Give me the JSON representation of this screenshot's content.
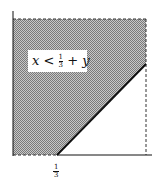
{
  "diagram": {
    "region_label": {
      "lhs": "x",
      "op": "<",
      "num": "1",
      "den": "3",
      "rest": "+ y"
    },
    "x_tick": {
      "num": "1",
      "den": "3"
    },
    "colors": {
      "shade": "#9a9a9a",
      "line": "#111111",
      "background": "#ffffff"
    }
  }
}
